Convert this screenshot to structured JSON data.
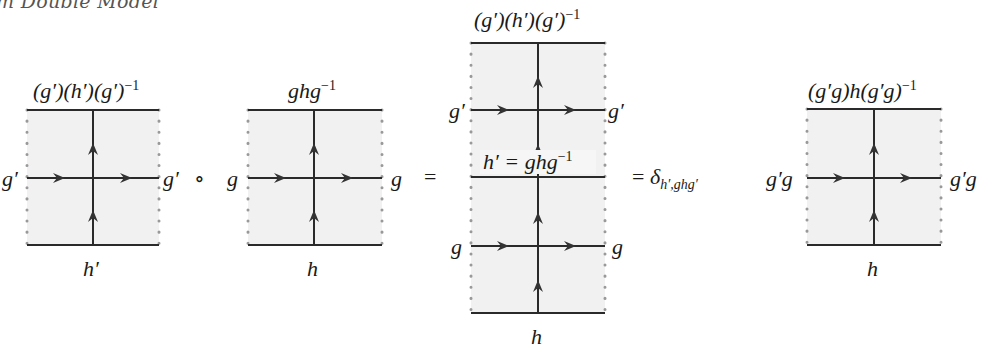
{
  "caption": "m Double Model",
  "diagrams": [
    {
      "id": "box1",
      "top": "(g′)(h′)(g′)",
      "top_exp": "−1",
      "left": "g′",
      "right": "g′",
      "bottom": "h′"
    },
    {
      "id": "box2",
      "top": "ghg",
      "top_exp": "−1",
      "left": "g",
      "right": "g",
      "bottom": "h"
    },
    {
      "id": "stacked",
      "top": "(g′)(h′)(g′)",
      "top_exp": "−1",
      "upper_left": "g′",
      "upper_right": "g′",
      "middle": "h′ = ghg",
      "middle_exp": "−1",
      "lower_left": "g",
      "lower_right": "g",
      "bottom": "h"
    },
    {
      "id": "box3",
      "top": "(g′g)h(g′g)",
      "top_exp": "−1",
      "left": "g′g",
      "right": "g′g",
      "bottom": "h"
    }
  ],
  "operators": {
    "compose": "∘",
    "equals1": "=",
    "equals2": "=",
    "delta": "δ",
    "delta_sub": "h′,ghg′"
  }
}
